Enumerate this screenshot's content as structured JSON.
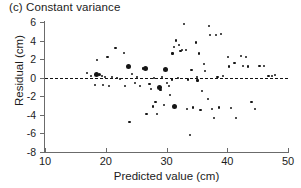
{
  "figure": {
    "panel_title": "(c) Constant variance"
  },
  "chart_data": {
    "type": "scatter",
    "title": "(c) Constant variance",
    "xlabel": "Predicted value (cm)",
    "ylabel": "Residual (cm)",
    "xlim": [
      10,
      50
    ],
    "ylim": [
      -8,
      6
    ],
    "xticks": [
      10,
      20,
      30,
      40,
      50
    ],
    "yticks": [
      -8,
      -6,
      -4,
      -2,
      0,
      2,
      4,
      6
    ],
    "xtick_labels": [
      "10",
      "20",
      "30",
      "40",
      "50"
    ],
    "ytick_labels": [
      "-8",
      "-6",
      "-4",
      "-2",
      "0",
      "2",
      "4",
      "6"
    ],
    "grid": false,
    "legend": false,
    "reference_line": {
      "type": "horizontal",
      "value": 0,
      "style": "dashed",
      "color": "#111111"
    },
    "marker_color": "#151515",
    "series": [
      {
        "name": "Residuals",
        "marker": "circle",
        "points": [
          {
            "x": 16.9,
            "y": 0.5,
            "size": "s"
          },
          {
            "x": 17.6,
            "y": 0.2,
            "size": "s"
          },
          {
            "x": 18.2,
            "y": -0.8,
            "size": "s"
          },
          {
            "x": 18.5,
            "y": 0.4,
            "size": "l"
          },
          {
            "x": 18.6,
            "y": 1.9,
            "size": "s"
          },
          {
            "x": 19.0,
            "y": 0.3,
            "size": "m"
          },
          {
            "x": 19.4,
            "y": 0.2,
            "size": "s"
          },
          {
            "x": 19.6,
            "y": -0.8,
            "size": "s"
          },
          {
            "x": 19.9,
            "y": 0.1,
            "size": "s"
          },
          {
            "x": 20.3,
            "y": 2.2,
            "size": "s"
          },
          {
            "x": 20.6,
            "y": -0.9,
            "size": "s"
          },
          {
            "x": 21.0,
            "y": 0.1,
            "size": "s"
          },
          {
            "x": 21.6,
            "y": 3.2,
            "size": "s"
          },
          {
            "x": 21.8,
            "y": 0.0,
            "size": "s"
          },
          {
            "x": 22.4,
            "y": -0.1,
            "size": "s"
          },
          {
            "x": 23.0,
            "y": 2.7,
            "size": "s"
          },
          {
            "x": 23.2,
            "y": -0.9,
            "size": "s"
          },
          {
            "x": 23.7,
            "y": 1.2,
            "size": "l"
          },
          {
            "x": 23.9,
            "y": -4.8,
            "size": "s"
          },
          {
            "x": 24.3,
            "y": 0.4,
            "size": "s"
          },
          {
            "x": 24.8,
            "y": -0.6,
            "size": "s"
          },
          {
            "x": 25.2,
            "y": 0.1,
            "size": "s"
          },
          {
            "x": 25.6,
            "y": -0.9,
            "size": "s"
          },
          {
            "x": 26.1,
            "y": 1.0,
            "size": "s"
          },
          {
            "x": 26.5,
            "y": 1.0,
            "size": "l"
          },
          {
            "x": 26.7,
            "y": -3.9,
            "size": "s"
          },
          {
            "x": 27.2,
            "y": -0.7,
            "size": "s"
          },
          {
            "x": 27.4,
            "y": -1.2,
            "size": "s"
          },
          {
            "x": 27.8,
            "y": -3.1,
            "size": "s"
          },
          {
            "x": 28.0,
            "y": 0.0,
            "size": "s"
          },
          {
            "x": 28.2,
            "y": -2.6,
            "size": "s"
          },
          {
            "x": 28.5,
            "y": -3.9,
            "size": "s"
          },
          {
            "x": 28.8,
            "y": -1.1,
            "size": "l"
          },
          {
            "x": 29.0,
            "y": -1.3,
            "size": "s"
          },
          {
            "x": 29.3,
            "y": 0.1,
            "size": "s"
          },
          {
            "x": 29.6,
            "y": -2.9,
            "size": "s"
          },
          {
            "x": 29.9,
            "y": 0.9,
            "size": "l"
          },
          {
            "x": 30.1,
            "y": -0.6,
            "size": "s"
          },
          {
            "x": 30.4,
            "y": -0.9,
            "size": "s"
          },
          {
            "x": 30.6,
            "y": -1.9,
            "size": "s"
          },
          {
            "x": 30.9,
            "y": -0.2,
            "size": "s"
          },
          {
            "x": 31.0,
            "y": 2.6,
            "size": "s"
          },
          {
            "x": 31.2,
            "y": 3.3,
            "size": "s"
          },
          {
            "x": 31.3,
            "y": -3.1,
            "size": "l"
          },
          {
            "x": 31.6,
            "y": 4.0,
            "size": "s"
          },
          {
            "x": 31.9,
            "y": 0.0,
            "size": "s"
          },
          {
            "x": 32.0,
            "y": 3.5,
            "size": "s"
          },
          {
            "x": 32.3,
            "y": 2.9,
            "size": "s"
          },
          {
            "x": 32.6,
            "y": 3.0,
            "size": "s"
          },
          {
            "x": 32.9,
            "y": 5.8,
            "size": "s"
          },
          {
            "x": 33.2,
            "y": 3.0,
            "size": "s"
          },
          {
            "x": 33.4,
            "y": -3.4,
            "size": "s"
          },
          {
            "x": 33.6,
            "y": -0.2,
            "size": "s"
          },
          {
            "x": 33.9,
            "y": -6.2,
            "size": "s"
          },
          {
            "x": 34.1,
            "y": 0.8,
            "size": "s"
          },
          {
            "x": 34.4,
            "y": -3.2,
            "size": "s"
          },
          {
            "x": 34.8,
            "y": 3.8,
            "size": "s"
          },
          {
            "x": 35.0,
            "y": 0.1,
            "size": "s"
          },
          {
            "x": 35.1,
            "y": -0.3,
            "size": "s"
          },
          {
            "x": 35.3,
            "y": 2.6,
            "size": "s"
          },
          {
            "x": 35.6,
            "y": -3.5,
            "size": "s"
          },
          {
            "x": 35.9,
            "y": -1.4,
            "size": "s"
          },
          {
            "x": 36.2,
            "y": 1.5,
            "size": "s"
          },
          {
            "x": 36.4,
            "y": 0.7,
            "size": "s"
          },
          {
            "x": 36.8,
            "y": -2.3,
            "size": "s"
          },
          {
            "x": 37.0,
            "y": 5.6,
            "size": "s"
          },
          {
            "x": 37.2,
            "y": 4.6,
            "size": "s"
          },
          {
            "x": 37.5,
            "y": -3.4,
            "size": "s"
          },
          {
            "x": 37.8,
            "y": -4.3,
            "size": "s"
          },
          {
            "x": 38.1,
            "y": 4.6,
            "size": "s"
          },
          {
            "x": 38.4,
            "y": 0.1,
            "size": "s"
          },
          {
            "x": 38.7,
            "y": -3.2,
            "size": "s"
          },
          {
            "x": 39.0,
            "y": 4.7,
            "size": "s"
          },
          {
            "x": 39.3,
            "y": 0.2,
            "size": "s"
          },
          {
            "x": 40.1,
            "y": 2.2,
            "size": "s"
          },
          {
            "x": 40.3,
            "y": 1.2,
            "size": "s"
          },
          {
            "x": 40.6,
            "y": -3.3,
            "size": "s"
          },
          {
            "x": 41.2,
            "y": 1.6,
            "size": "s"
          },
          {
            "x": 41.5,
            "y": -4.3,
            "size": "s"
          },
          {
            "x": 42.3,
            "y": 2.3,
            "size": "s"
          },
          {
            "x": 42.6,
            "y": 1.3,
            "size": "s"
          },
          {
            "x": 43.1,
            "y": 2.2,
            "size": "s"
          },
          {
            "x": 43.4,
            "y": 1.2,
            "size": "s"
          },
          {
            "x": 44.0,
            "y": -2.6,
            "size": "s"
          },
          {
            "x": 44.6,
            "y": -3.4,
            "size": "s"
          },
          {
            "x": 45.3,
            "y": 1.3,
            "size": "s"
          },
          {
            "x": 46.1,
            "y": 1.3,
            "size": "s"
          },
          {
            "x": 46.8,
            "y": 0.2,
            "size": "s"
          },
          {
            "x": 47.4,
            "y": 0.2,
            "size": "s"
          },
          {
            "x": 47.8,
            "y": 0.3,
            "size": "s"
          }
        ]
      }
    ]
  }
}
